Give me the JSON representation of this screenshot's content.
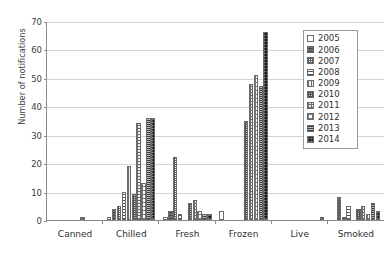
{
  "chart_data": {
    "type": "bar",
    "title": "",
    "subtitle": "",
    "xlabel": "",
    "ylabel": "Number of notifications",
    "ylim": [
      0,
      70
    ],
    "yticks": [
      0,
      10,
      20,
      30,
      40,
      50,
      60,
      70
    ],
    "grid": true,
    "legend_position": "top-right",
    "categories": [
      "Canned",
      "Chilled",
      "Fresh",
      "Frozen",
      "Live",
      "Smoked"
    ],
    "series": [
      {
        "name": "2005",
        "pattern": "empty-white",
        "values": [
          0,
          1,
          1,
          3,
          0,
          0
        ]
      },
      {
        "name": "2006",
        "pattern": "dark-grey-solid",
        "values": [
          0,
          4,
          3,
          0,
          0,
          8
        ]
      },
      {
        "name": "2007",
        "pattern": "fine-checker",
        "values": [
          0,
          5,
          22,
          0,
          0,
          1
        ]
      },
      {
        "name": "2008",
        "pattern": "horizontal-lines",
        "values": [
          0,
          10,
          2,
          0,
          0,
          5
        ]
      },
      {
        "name": "2009",
        "pattern": "vertical-lines",
        "values": [
          0,
          19,
          0,
          0,
          0,
          0
        ]
      },
      {
        "name": "2010",
        "pattern": "dense-checker",
        "values": [
          0,
          9,
          6,
          35,
          0,
          4
        ]
      },
      {
        "name": "2011",
        "pattern": "grid-waffle",
        "values": [
          1,
          34,
          7,
          48,
          0,
          5
        ]
      },
      {
        "name": "2012",
        "pattern": "sparse-dots",
        "values": [
          0,
          13,
          3,
          51,
          0,
          2
        ]
      },
      {
        "name": "2013",
        "pattern": "horizontal-bands",
        "values": [
          0,
          36,
          2,
          47,
          0,
          6
        ]
      },
      {
        "name": "2014",
        "pattern": "solid-black",
        "values": [
          0,
          36,
          2,
          66,
          1,
          3
        ]
      }
    ]
  },
  "legend": {
    "entries": [
      {
        "label": "2005"
      },
      {
        "label": "2006"
      },
      {
        "label": "2007"
      },
      {
        "label": "2008"
      },
      {
        "label": "2009"
      },
      {
        "label": "2010"
      },
      {
        "label": "2011"
      },
      {
        "label": "2012"
      },
      {
        "label": "2013"
      },
      {
        "label": "2014"
      }
    ]
  },
  "colors": {
    "axis": "#8a8a8a",
    "gridline": "#d4d4d4",
    "text": "#2f2f2f",
    "background": "#ffffff"
  }
}
